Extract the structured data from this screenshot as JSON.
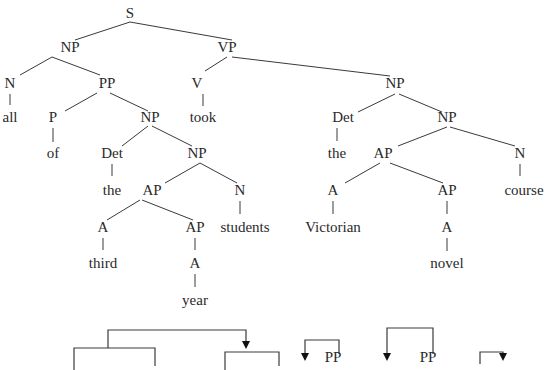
{
  "diagram": {
    "type": "syntax-tree",
    "colors": {
      "text": "#2a2a2a",
      "line": "#3a3a3a",
      "background": "#ffffff"
    },
    "nodes": [
      {
        "id": "s",
        "label": "S",
        "x": 130,
        "y": 18
      },
      {
        "id": "np1",
        "label": "NP",
        "x": 70,
        "y": 52
      },
      {
        "id": "vp",
        "label": "VP",
        "x": 227,
        "y": 52
      },
      {
        "id": "n1",
        "label": "N",
        "x": 10,
        "y": 88
      },
      {
        "id": "all",
        "label": "all",
        "x": 10,
        "y": 122
      },
      {
        "id": "pp",
        "label": "PP",
        "x": 107,
        "y": 88
      },
      {
        "id": "p",
        "label": "P",
        "x": 53,
        "y": 122
      },
      {
        "id": "of",
        "label": "of",
        "x": 53,
        "y": 158
      },
      {
        "id": "np2",
        "label": "NP",
        "x": 150,
        "y": 122
      },
      {
        "id": "det1",
        "label": "Det",
        "x": 112,
        "y": 158
      },
      {
        "id": "the1",
        "label": "the",
        "x": 112,
        "y": 195
      },
      {
        "id": "np3",
        "label": "NP",
        "x": 197,
        "y": 158
      },
      {
        "id": "ap1",
        "label": "AP",
        "x": 152,
        "y": 195
      },
      {
        "id": "n2",
        "label": "N",
        "x": 240,
        "y": 195
      },
      {
        "id": "students",
        "label": "students",
        "x": 245,
        "y": 232
      },
      {
        "id": "a1",
        "label": "A",
        "x": 103,
        "y": 232
      },
      {
        "id": "third",
        "label": "third",
        "x": 103,
        "y": 268
      },
      {
        "id": "ap2",
        "label": "AP",
        "x": 195,
        "y": 232
      },
      {
        "id": "a2",
        "label": "A",
        "x": 195,
        "y": 268
      },
      {
        "id": "year",
        "label": "year",
        "x": 195,
        "y": 305
      },
      {
        "id": "v",
        "label": "V",
        "x": 197,
        "y": 88
      },
      {
        "id": "took",
        "label": "took",
        "x": 203,
        "y": 122
      },
      {
        "id": "np4",
        "label": "NP",
        "x": 395,
        "y": 88
      },
      {
        "id": "det2",
        "label": "Det",
        "x": 343,
        "y": 122
      },
      {
        "id": "the2",
        "label": "the",
        "x": 337,
        "y": 158
      },
      {
        "id": "np5",
        "label": "NP",
        "x": 447,
        "y": 122
      },
      {
        "id": "ap3",
        "label": "AP",
        "x": 383,
        "y": 158
      },
      {
        "id": "n3",
        "label": "N",
        "x": 520,
        "y": 158
      },
      {
        "id": "course",
        "label": "course",
        "x": 524,
        "y": 195
      },
      {
        "id": "a3",
        "label": "A",
        "x": 333,
        "y": 195
      },
      {
        "id": "victorian",
        "label": "Victorian",
        "x": 333,
        "y": 232
      },
      {
        "id": "ap4",
        "label": "AP",
        "x": 447,
        "y": 195
      },
      {
        "id": "a4",
        "label": "A",
        "x": 447,
        "y": 232
      },
      {
        "id": "novel",
        "label": "novel",
        "x": 447,
        "y": 268
      },
      {
        "id": "pp_b1",
        "label": "PP",
        "x": 333,
        "y": 362
      },
      {
        "id": "pp_b2",
        "label": "PP",
        "x": 428,
        "y": 362
      }
    ],
    "edges": [
      [
        130,
        22,
        75,
        40
      ],
      [
        130,
        22,
        232,
        40
      ],
      [
        52,
        57,
        20,
        75
      ],
      [
        52,
        57,
        100,
        75
      ],
      [
        10,
        94,
        10,
        105
      ],
      [
        97,
        93,
        65,
        111
      ],
      [
        110,
        93,
        148,
        111
      ],
      [
        53,
        128,
        53,
        142
      ],
      [
        148,
        126,
        122,
        146
      ],
      [
        152,
        126,
        192,
        146
      ],
      [
        112,
        164,
        112,
        176
      ],
      [
        200,
        163,
        165,
        183
      ],
      [
        200,
        163,
        237,
        183
      ],
      [
        240,
        201,
        240,
        214
      ],
      [
        140,
        200,
        107,
        220
      ],
      [
        142,
        200,
        193,
        220
      ],
      [
        103,
        238,
        103,
        250
      ],
      [
        195,
        238,
        195,
        250
      ],
      [
        195,
        274,
        195,
        287
      ],
      [
        227,
        57,
        205,
        71
      ],
      [
        232,
        57,
        390,
        76
      ],
      [
        203,
        94,
        203,
        106
      ],
      [
        395,
        94,
        358,
        112
      ],
      [
        399,
        94,
        442,
        112
      ],
      [
        337,
        128,
        337,
        141
      ],
      [
        447,
        127,
        398,
        146
      ],
      [
        450,
        127,
        515,
        146
      ],
      [
        520,
        164,
        520,
        176
      ],
      [
        380,
        163,
        345,
        183
      ],
      [
        390,
        163,
        443,
        183
      ],
      [
        333,
        201,
        333,
        214
      ],
      [
        447,
        201,
        447,
        214
      ],
      [
        447,
        238,
        447,
        251
      ]
    ],
    "brackets": {
      "description": "dependency arcs below the tree (partially cropped)",
      "items": [
        {
          "name": "outer-arc",
          "path": "M108,348 L108,330 L246,330 L246,342",
          "arrow_at": [
            246,
            348
          ]
        },
        {
          "name": "left-arc",
          "path": "M74,370 L74,348 L155,348 L155,366",
          "arrow_at": null
        },
        {
          "name": "right-arc",
          "path": "M225,370 L225,352 L279,352 L279,366",
          "arrow_at": null
        },
        {
          "name": "pp-arc-1",
          "path": "M339,354 L339,340 L305,340 L305,354",
          "arrow_at": [
            305,
            360
          ]
        },
        {
          "name": "pp-arc-2",
          "path": "M433,354 L433,328 L387,328 L387,354",
          "arrow_at": [
            387,
            360
          ]
        },
        {
          "name": "small-arc",
          "path": "M480,364 L480,352 L503,352 L503,356",
          "arrow_at": [
            503,
            360
          ]
        }
      ]
    }
  }
}
